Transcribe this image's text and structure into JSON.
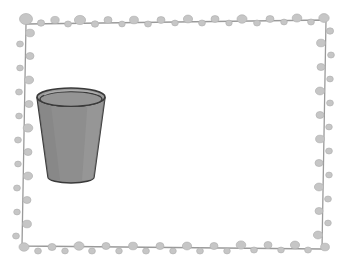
{
  "illustration": {
    "title": "Water displacement science illustration",
    "description": "A decorative beaded frame containing a cup, an egg, and a rectangular water tank",
    "background_color": "#ffffff"
  },
  "frame": {
    "name": "beaded-border-frame",
    "line_color": "#9a9a9a",
    "bead_color": "#c6c6c6",
    "bead_stroke_color": "#b0b0b0",
    "line_width": 1.2,
    "corners": {
      "top_left": [
        26,
        24
      ],
      "top_right": [
        326,
        20
      ],
      "bottom_right": [
        322,
        249
      ],
      "bottom_left": [
        22,
        246
      ]
    },
    "beads_top": [
      {
        "x": 26,
        "y": 19,
        "rx": 6.5,
        "ry": 5.5
      },
      {
        "x": 41,
        "y": 23,
        "rx": 3.6,
        "ry": 3.2
      },
      {
        "x": 55,
        "y": 20,
        "rx": 4.2,
        "ry": 3.6
      },
      {
        "x": 68,
        "y": 24,
        "rx": 3.4,
        "ry": 3.0
      },
      {
        "x": 80,
        "y": 20,
        "rx": 5.6,
        "ry": 4.6
      },
      {
        "x": 95,
        "y": 24,
        "rx": 3.6,
        "ry": 3.2
      },
      {
        "x": 108,
        "y": 20,
        "rx": 4.0,
        "ry": 3.4
      },
      {
        "x": 122,
        "y": 24,
        "rx": 3.2,
        "ry": 2.9
      },
      {
        "x": 134,
        "y": 20,
        "rx": 4.4,
        "ry": 3.8
      },
      {
        "x": 148,
        "y": 24,
        "rx": 3.4,
        "ry": 3.0
      },
      {
        "x": 161,
        "y": 20,
        "rx": 4.0,
        "ry": 3.4
      },
      {
        "x": 175,
        "y": 23,
        "rx": 3.3,
        "ry": 2.9
      },
      {
        "x": 188,
        "y": 19,
        "rx": 4.6,
        "ry": 3.9
      },
      {
        "x": 202,
        "y": 23,
        "rx": 3.4,
        "ry": 3.0
      },
      {
        "x": 215,
        "y": 19,
        "rx": 4.0,
        "ry": 3.4
      },
      {
        "x": 229,
        "y": 23,
        "rx": 3.2,
        "ry": 2.9
      },
      {
        "x": 242,
        "y": 19,
        "rx": 5.0,
        "ry": 4.2
      },
      {
        "x": 257,
        "y": 23,
        "rx": 3.4,
        "ry": 3.0
      },
      {
        "x": 270,
        "y": 19,
        "rx": 4.0,
        "ry": 3.4
      },
      {
        "x": 284,
        "y": 22,
        "rx": 3.3,
        "ry": 2.9
      },
      {
        "x": 297,
        "y": 18,
        "rx": 4.8,
        "ry": 4.0
      },
      {
        "x": 311,
        "y": 22,
        "rx": 3.4,
        "ry": 3.0
      },
      {
        "x": 324,
        "y": 18,
        "rx": 5.2,
        "ry": 4.4
      }
    ],
    "beads_right": [
      {
        "x": 330,
        "y": 31,
        "rx": 3.6,
        "ry": 3.2
      },
      {
        "x": 321,
        "y": 43,
        "rx": 4.4,
        "ry": 3.8
      },
      {
        "x": 331,
        "y": 55,
        "rx": 3.4,
        "ry": 3.0
      },
      {
        "x": 321,
        "y": 67,
        "rx": 4.0,
        "ry": 3.5
      },
      {
        "x": 330,
        "y": 79,
        "rx": 3.3,
        "ry": 2.9
      },
      {
        "x": 320,
        "y": 91,
        "rx": 4.6,
        "ry": 3.9
      },
      {
        "x": 330,
        "y": 103,
        "rx": 3.4,
        "ry": 3.0
      },
      {
        "x": 320,
        "y": 115,
        "rx": 4.0,
        "ry": 3.5
      },
      {
        "x": 329,
        "y": 127,
        "rx": 3.3,
        "ry": 2.9
      },
      {
        "x": 320,
        "y": 139,
        "rx": 4.4,
        "ry": 3.8
      },
      {
        "x": 329,
        "y": 151,
        "rx": 3.4,
        "ry": 3.0
      },
      {
        "x": 319,
        "y": 163,
        "rx": 4.0,
        "ry": 3.5
      },
      {
        "x": 329,
        "y": 175,
        "rx": 3.3,
        "ry": 2.9
      },
      {
        "x": 319,
        "y": 187,
        "rx": 4.6,
        "ry": 3.9
      },
      {
        "x": 328,
        "y": 199,
        "rx": 3.4,
        "ry": 3.0
      },
      {
        "x": 319,
        "y": 211,
        "rx": 4.0,
        "ry": 3.5
      },
      {
        "x": 328,
        "y": 223,
        "rx": 3.3,
        "ry": 2.9
      },
      {
        "x": 318,
        "y": 235,
        "rx": 4.6,
        "ry": 3.9
      },
      {
        "x": 325,
        "y": 247,
        "rx": 4.4,
        "ry": 3.8
      }
    ],
    "beads_bottom": [
      {
        "x": 308,
        "y": 250,
        "rx": 3.4,
        "ry": 3.0
      },
      {
        "x": 295,
        "y": 245,
        "rx": 4.6,
        "ry": 3.9
      },
      {
        "x": 281,
        "y": 250,
        "rx": 3.3,
        "ry": 2.9
      },
      {
        "x": 268,
        "y": 245,
        "rx": 4.0,
        "ry": 3.5
      },
      {
        "x": 254,
        "y": 250,
        "rx": 3.4,
        "ry": 3.0
      },
      {
        "x": 241,
        "y": 245,
        "rx": 4.8,
        "ry": 4.1
      },
      {
        "x": 227,
        "y": 251,
        "rx": 3.3,
        "ry": 2.9
      },
      {
        "x": 214,
        "y": 246,
        "rx": 4.0,
        "ry": 3.5
      },
      {
        "x": 200,
        "y": 251,
        "rx": 3.4,
        "ry": 3.0
      },
      {
        "x": 187,
        "y": 246,
        "rx": 4.6,
        "ry": 3.9
      },
      {
        "x": 173,
        "y": 251,
        "rx": 3.3,
        "ry": 2.9
      },
      {
        "x": 160,
        "y": 246,
        "rx": 4.0,
        "ry": 3.5
      },
      {
        "x": 146,
        "y": 251,
        "rx": 3.4,
        "ry": 3.0
      },
      {
        "x": 133,
        "y": 246,
        "rx": 4.4,
        "ry": 3.8
      },
      {
        "x": 119,
        "y": 251,
        "rx": 3.3,
        "ry": 2.9
      },
      {
        "x": 106,
        "y": 246,
        "rx": 4.0,
        "ry": 3.5
      },
      {
        "x": 92,
        "y": 251,
        "rx": 3.4,
        "ry": 3.0
      },
      {
        "x": 79,
        "y": 246,
        "rx": 5.0,
        "ry": 4.2
      },
      {
        "x": 65,
        "y": 251,
        "rx": 3.3,
        "ry": 2.9
      },
      {
        "x": 52,
        "y": 247,
        "rx": 4.0,
        "ry": 3.5
      },
      {
        "x": 38,
        "y": 251,
        "rx": 3.4,
        "ry": 3.0
      },
      {
        "x": 24,
        "y": 247,
        "rx": 5.0,
        "ry": 4.2
      }
    ],
    "beads_left": [
      {
        "x": 16,
        "y": 236,
        "rx": 3.4,
        "ry": 3.0
      },
      {
        "x": 27,
        "y": 224,
        "rx": 4.4,
        "ry": 3.8
      },
      {
        "x": 17,
        "y": 212,
        "rx": 3.3,
        "ry": 2.9
      },
      {
        "x": 27,
        "y": 200,
        "rx": 4.0,
        "ry": 3.5
      },
      {
        "x": 17,
        "y": 188,
        "rx": 3.4,
        "ry": 3.0
      },
      {
        "x": 28,
        "y": 176,
        "rx": 4.6,
        "ry": 3.9
      },
      {
        "x": 18,
        "y": 164,
        "rx": 3.3,
        "ry": 2.9
      },
      {
        "x": 28,
        "y": 152,
        "rx": 4.0,
        "ry": 3.5
      },
      {
        "x": 18,
        "y": 140,
        "rx": 3.4,
        "ry": 3.0
      },
      {
        "x": 28,
        "y": 128,
        "rx": 4.8,
        "ry": 4.1
      },
      {
        "x": 19,
        "y": 116,
        "rx": 3.3,
        "ry": 2.9
      },
      {
        "x": 29,
        "y": 104,
        "rx": 4.0,
        "ry": 3.5
      },
      {
        "x": 19,
        "y": 92,
        "rx": 3.4,
        "ry": 3.0
      },
      {
        "x": 29,
        "y": 80,
        "rx": 4.6,
        "ry": 3.9
      },
      {
        "x": 20,
        "y": 68,
        "rx": 3.3,
        "ry": 2.9
      },
      {
        "x": 30,
        "y": 56,
        "rx": 4.0,
        "ry": 3.5
      },
      {
        "x": 20,
        "y": 44,
        "rx": 3.4,
        "ry": 3.0
      },
      {
        "x": 30,
        "y": 33,
        "rx": 4.4,
        "ry": 3.8
      }
    ]
  },
  "objects": {
    "cup": {
      "name": "cup",
      "label": "Cup",
      "fill_color": "#8e8e8e",
      "rim_fill_color": "#9c9c9c",
      "stroke_color": "#3a3a3a",
      "highlight_color": "#a6a6a6",
      "top_center_x": 71,
      "top_center_y": 97,
      "top_rx": 34,
      "top_ry": 9,
      "bottom_center_x": 71,
      "bottom_center_y": 177,
      "bottom_rx": 23,
      "bottom_ry": 6
    },
    "egg": {
      "name": "egg",
      "label": "Egg",
      "fill_color": "#d6d6d6",
      "stroke_color": "#3a3a3a",
      "highlight_color": "#f2f2f2",
      "center_x": 123,
      "center_y": 176,
      "rx": 22,
      "ry": 27,
      "rotation_deg": -28
    },
    "tank": {
      "name": "water-tank",
      "label": "Water tank",
      "glass_stroke_color": "#2e2e2e",
      "water_fill_color": "#a5a5a5",
      "water_side_fill_color": "#9a9a9a",
      "water_top_fill_color": "#8f8f8f",
      "water_surface_color": "#4a4a4a",
      "highlight_color": "#ffffff",
      "front_left_x": 153,
      "front_right_x": 288,
      "front_top_y": 96,
      "front_bottom_y": 182,
      "depth_dx": 26,
      "depth_dy": -22,
      "water_level_y": 113,
      "water_fill_percent": 75
    }
  }
}
